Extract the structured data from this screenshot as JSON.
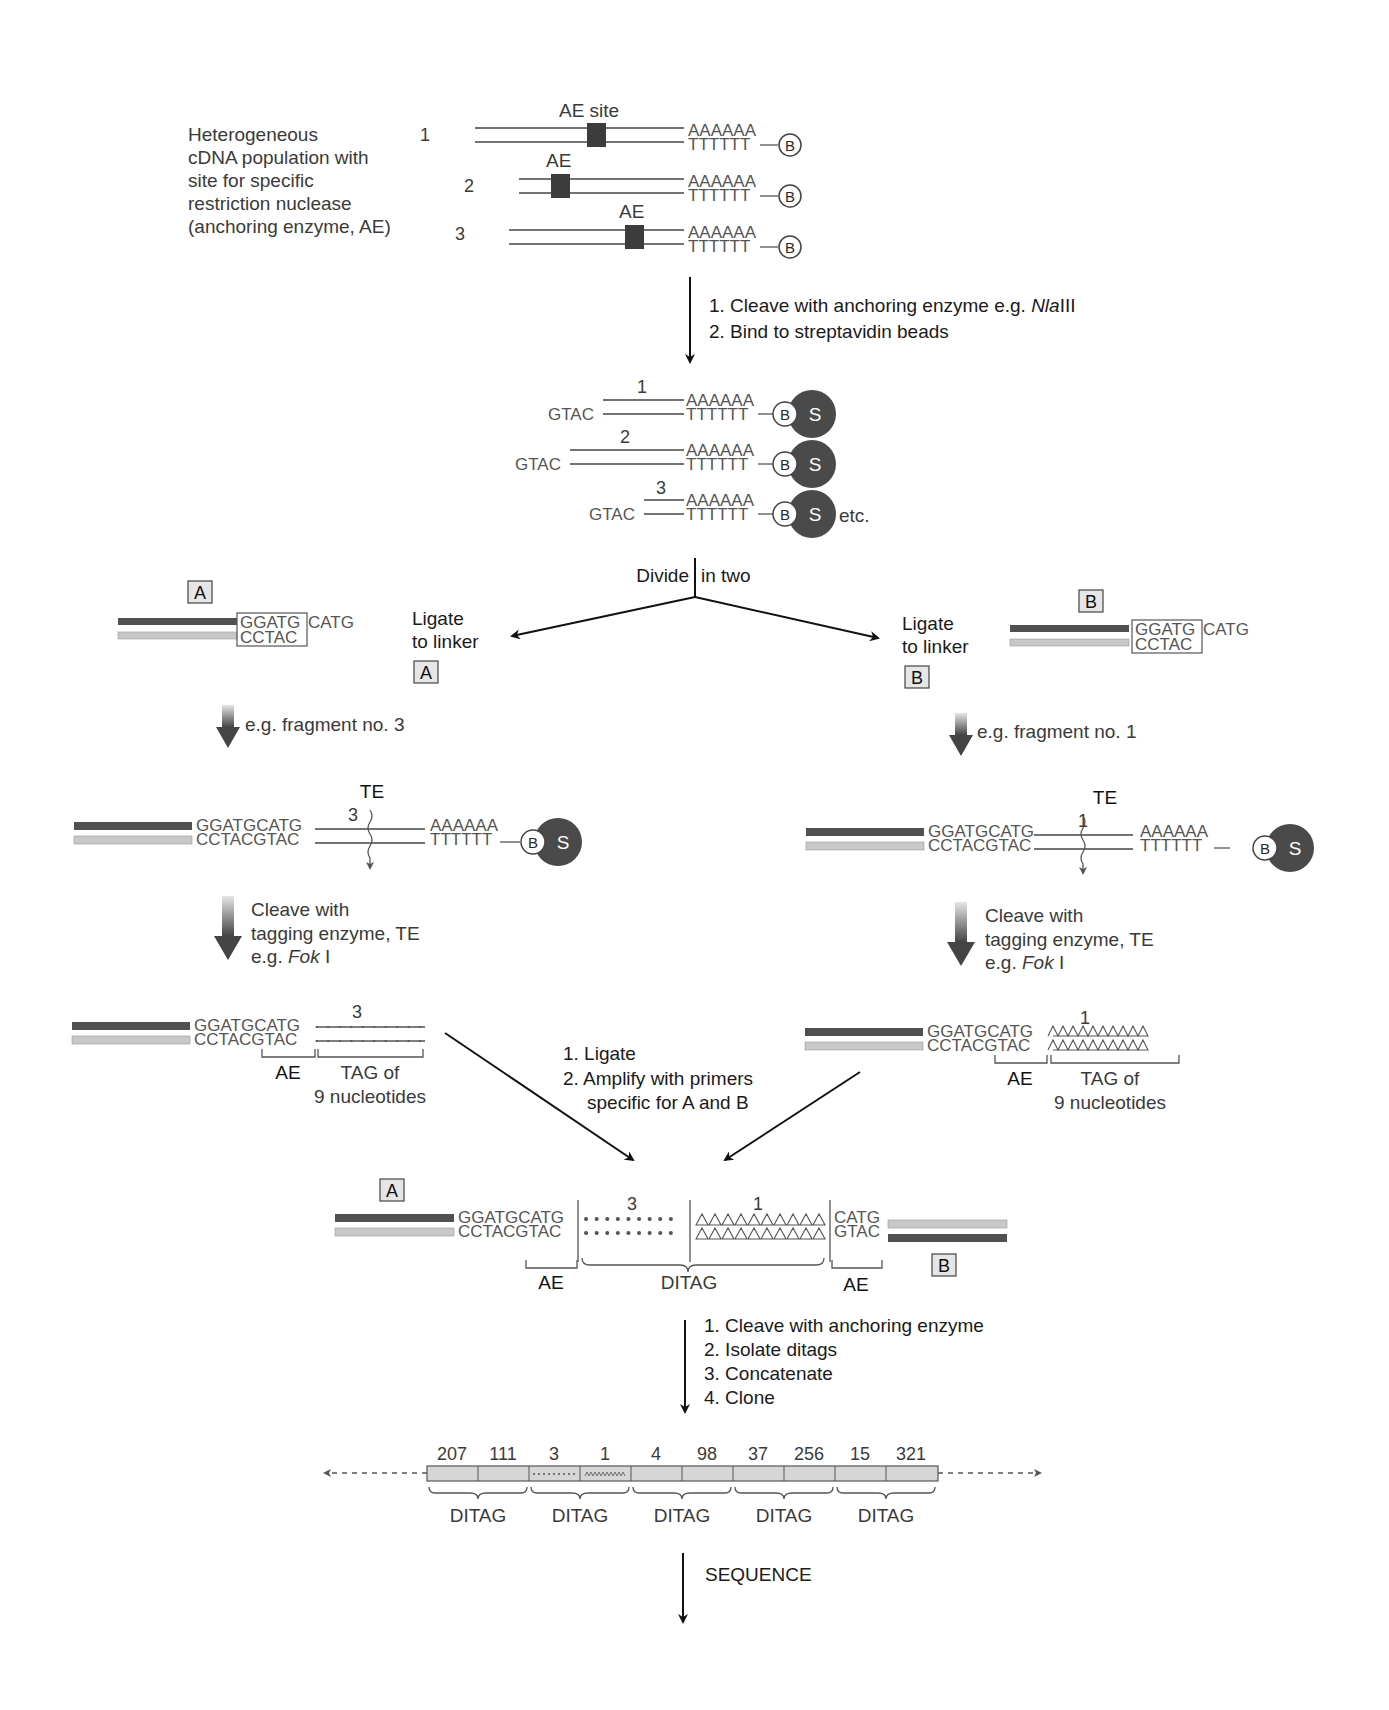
{
  "colors": {
    "dark_strand": "#505050",
    "light_strand": "#c8c8c8",
    "bead": "#4a4a4a",
    "ae_box": "#3c3c3c",
    "linker_box": "#e6e6e6"
  },
  "intro": {
    "description": [
      "Heterogeneous",
      "cDNA population with",
      "site for specific",
      "restriction nuclease",
      "(anchoring enzyme, AE)"
    ],
    "rows": [
      {
        "num": "1",
        "ae_label": "AE site",
        "polyA": "AAAAAA",
        "polyT": "TTTTTT",
        "biotin": "B"
      },
      {
        "num": "2",
        "ae_label": "AE",
        "polyA": "AAAAAA",
        "polyT": "TTTTTT",
        "biotin": "B"
      },
      {
        "num": "3",
        "ae_label": "AE",
        "polyA": "AAAAAA",
        "polyT": "TTTTTT",
        "biotin": "B"
      }
    ]
  },
  "step1": {
    "line1_prefix": "1. Cleave with anchoring enzyme e.g. ",
    "line1_enzyme_italic": "Nla",
    "line1_enzyme_suffix": "III",
    "line2": "2. Bind to streptavidin beads"
  },
  "beads": {
    "rows": [
      {
        "num": "1",
        "overhang": "GTAC",
        "polyA": "AAAAAA",
        "polyT": "TTTTTT",
        "biotin": "B",
        "bead": "S"
      },
      {
        "num": "2",
        "overhang": "GTAC",
        "polyA": "AAAAAA",
        "polyT": "TTTTTT",
        "biotin": "B",
        "bead": "S"
      },
      {
        "num": "3",
        "overhang": "GTAC",
        "polyA": "AAAAAA",
        "polyT": "TTTTTT",
        "biotin": "B",
        "bead": "S"
      }
    ],
    "etc": "etc."
  },
  "divide": {
    "left": "Divide",
    "right": "in two"
  },
  "left_branch": {
    "linker_tag": "A",
    "linker_top": "GGATG",
    "linker_top_overhang": "CATG",
    "linker_bottom": "CCTAC",
    "ligate_line1": "Ligate",
    "ligate_line2": "to linker",
    "ligate_box": "A",
    "fragment_note": "e.g. fragment no. 3",
    "te_label": "TE",
    "fragment_num": "3",
    "seq_top": "GGATGCATG",
    "seq_bottom": "CCTACGTAC",
    "polyA": "AAAAAA",
    "polyT": "TTTTTT",
    "biotin": "B",
    "bead": "S",
    "cleave_line1": "Cleave with",
    "cleave_line2": "tagging enzyme, TE",
    "cleave_line3_prefix": "e.g. ",
    "cleave_enzyme_italic": "Fok",
    "cleave_enzyme_suffix": " I",
    "tag_num": "3",
    "tag_seq_top": "GGATGCATG",
    "tag_seq_bottom_a": "CCTAC",
    "tag_seq_bottom_b": "GTAC",
    "ae_label": "AE",
    "tag_label_line1": "TAG of",
    "tag_label_line2": "9 nucleotides"
  },
  "right_branch": {
    "linker_tag": "B",
    "linker_top": "GGATG",
    "linker_top_overhang": "CATG",
    "linker_bottom": "CCTAC",
    "ligate_line1": "Ligate",
    "ligate_line2": "to linker",
    "ligate_box": "B",
    "fragment_note": "e.g. fragment no. 1",
    "te_label": "TE",
    "fragment_num": "1",
    "seq_top": "GGATGCATG",
    "seq_bottom": "CCTACGTAC",
    "polyA": "AAAAAA",
    "polyT": "TTTTTT",
    "biotin": "B",
    "bead": "S",
    "cleave_line1": "Cleave with",
    "cleave_line2": "tagging enzyme, TE",
    "cleave_line3_prefix": "e.g. ",
    "cleave_enzyme_italic": "Fok",
    "cleave_enzyme_suffix": " I",
    "tag_num": "1",
    "tag_seq_top": "GGATGCATG",
    "tag_seq_bottom_a": "CCTAC",
    "tag_seq_bottom_b": "GTAC",
    "ae_label": "AE",
    "tag_label_line1": "TAG of",
    "tag_label_line2": "9 nucleotides"
  },
  "ligate_step": {
    "line1": "1. Ligate",
    "line2": "2. Amplify with primers",
    "line3": "specific for A and B"
  },
  "ditag": {
    "box_a": "A",
    "box_b": "B",
    "left_top": "GGATGCATG",
    "left_bottom_a": "CCTAC",
    "left_bottom_b": "GTAC",
    "tag_left_num": "3",
    "tag_right_num": "1",
    "right_top": "CATG",
    "right_bottom": "GTAC",
    "ae_left": "AE",
    "ditag_label": "DITAG",
    "ae_right": "AE"
  },
  "final_steps": [
    "1. Cleave with anchoring enzyme",
    "2. Isolate ditags",
    "3. Concatenate",
    "4. Clone"
  ],
  "concatemer": {
    "tags": [
      "207",
      "111",
      "3",
      "1",
      "4",
      "98",
      "37",
      "256",
      "15",
      "321"
    ],
    "ditag_labels": [
      "DITAG",
      "DITAG",
      "DITAG",
      "DITAG",
      "DITAG"
    ]
  },
  "sequence_label": "SEQUENCE"
}
